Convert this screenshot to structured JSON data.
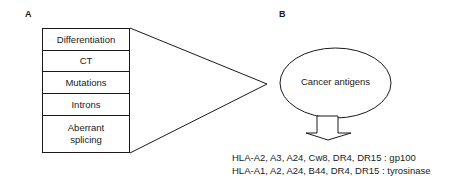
{
  "panels": {
    "a": {
      "label": "A",
      "categories": [
        {
          "label": "Differentiation"
        },
        {
          "label": "CT"
        },
        {
          "label": "Mutations"
        },
        {
          "label": "Introns"
        },
        {
          "label": "Aberrant\nsplicing"
        }
      ]
    },
    "b": {
      "label": "B",
      "ellipse_label": "Cancer antigens",
      "restrictions": [
        "HLA-A2, A3, A24, Cw8, DR4, DR15 : gp100",
        "HLA-A1, A2, A24, B44, DR4, DR15 : tyrosinase"
      ]
    }
  },
  "icons": {
    "arrow": "down-arrow-icon"
  }
}
